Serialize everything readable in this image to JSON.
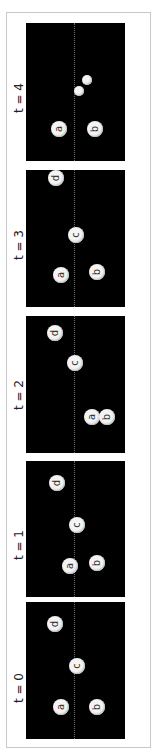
{
  "figure": {
    "orientation": "rotated-90-ccw",
    "panels": [
      {
        "label": "t = 4",
        "top": 23,
        "height": 138,
        "label_center_y": 98,
        "balls": [
          {
            "id": "a",
            "label": "a",
            "x": 59,
            "y": 129,
            "r": 8
          },
          {
            "id": "b",
            "label": "b",
            "x": 95,
            "y": 129,
            "r": 8
          },
          {
            "id": "small1",
            "label": "",
            "x": 79,
            "y": 91,
            "r": 5
          },
          {
            "id": "small2",
            "label": "",
            "x": 87,
            "y": 80,
            "r": 5
          }
        ]
      },
      {
        "label": "t = 3",
        "top": 170,
        "height": 137,
        "label_center_y": 245,
        "balls": [
          {
            "id": "d",
            "label": "d",
            "x": 56,
            "y": 178,
            "r": 8
          },
          {
            "id": "c",
            "label": "c",
            "x": 76,
            "y": 235,
            "r": 8
          },
          {
            "id": "a",
            "label": "a",
            "x": 61,
            "y": 275,
            "r": 8
          },
          {
            "id": "b",
            "label": "b",
            "x": 97,
            "y": 272,
            "r": 8
          }
        ]
      },
      {
        "label": "t = 2",
        "top": 316,
        "height": 137,
        "label_center_y": 395,
        "balls": [
          {
            "id": "d",
            "label": "d",
            "x": 55,
            "y": 333,
            "r": 8
          },
          {
            "id": "c",
            "label": "c",
            "x": 75,
            "y": 363,
            "r": 8
          },
          {
            "id": "a",
            "label": "a",
            "x": 92,
            "y": 417,
            "r": 8
          },
          {
            "id": "b",
            "label": "b",
            "x": 107,
            "y": 417,
            "r": 8
          }
        ]
      },
      {
        "label": "t = 1",
        "top": 461,
        "height": 136,
        "label_center_y": 545,
        "balls": [
          {
            "id": "d",
            "label": "d",
            "x": 57,
            "y": 483,
            "r": 8
          },
          {
            "id": "c",
            "label": "c",
            "x": 77,
            "y": 525,
            "r": 8
          },
          {
            "id": "a",
            "label": "a",
            "x": 70,
            "y": 566,
            "r": 8
          },
          {
            "id": "b",
            "label": "b",
            "x": 97,
            "y": 563,
            "r": 8
          }
        ]
      },
      {
        "label": "t = 0",
        "top": 602,
        "height": 137,
        "label_center_y": 688,
        "balls": [
          {
            "id": "d",
            "label": "d",
            "x": 55,
            "y": 624,
            "r": 8
          },
          {
            "id": "c",
            "label": "c",
            "x": 77,
            "y": 666,
            "r": 8
          },
          {
            "id": "a",
            "label": "a",
            "x": 61,
            "y": 707,
            "r": 8
          },
          {
            "id": "b",
            "label": "b",
            "x": 97,
            "y": 707,
            "r": 8
          }
        ]
      }
    ],
    "colors": {
      "panel_bg": "#000000",
      "ball_fill": "#f4f4f4",
      "frame_border": "#c8c8c8",
      "axis_line": "#6a6a6a"
    }
  }
}
